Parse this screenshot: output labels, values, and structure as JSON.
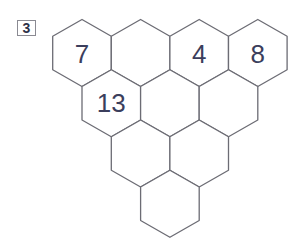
{
  "puzzle": {
    "label": "3",
    "grid_type": "hexagonal-triangle",
    "rows": [
      {
        "cells": [
          {
            "value": "7"
          },
          {
            "value": ""
          },
          {
            "value": "4"
          },
          {
            "value": "8"
          }
        ]
      },
      {
        "cells": [
          {
            "value": "13"
          },
          {
            "value": ""
          },
          {
            "value": ""
          }
        ]
      },
      {
        "cells": [
          {
            "value": ""
          },
          {
            "value": ""
          }
        ]
      },
      {
        "cells": [
          {
            "value": ""
          }
        ]
      }
    ]
  },
  "colors": {
    "line": "#6c6c74",
    "number": "#3b3e5c",
    "background": "#ffffff"
  }
}
